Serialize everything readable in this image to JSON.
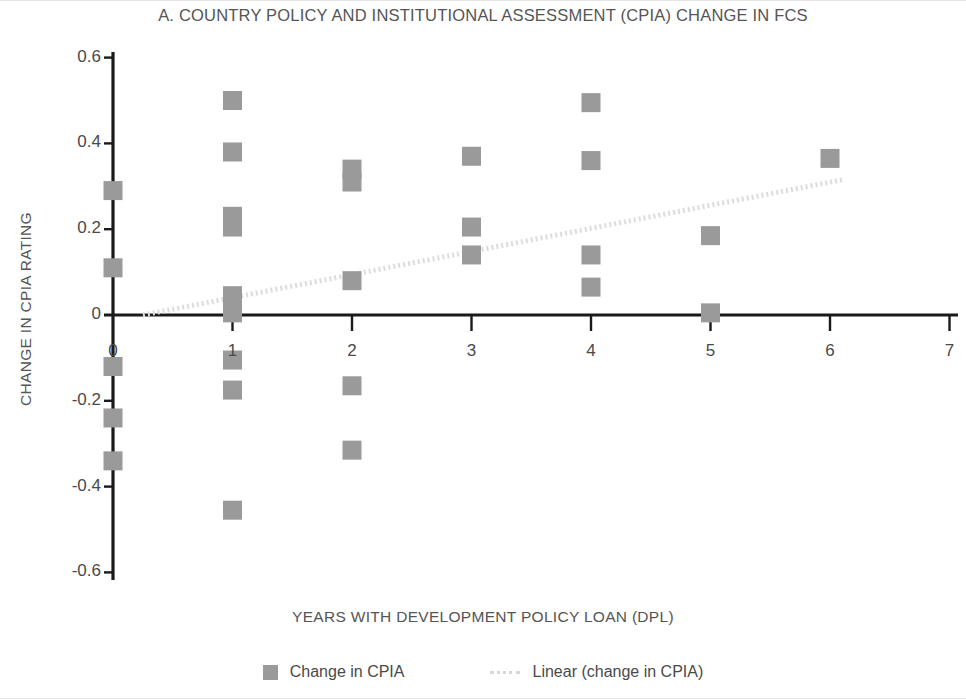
{
  "chart_data": {
    "type": "scatter",
    "title": "A. COUNTRY POLICY AND INSTITUTIONAL ASSESSMENT (CPIA) CHANGE IN FCS",
    "xlabel": "YEARS WITH DEVELOPMENT POLICY LOAN (DPL)",
    "ylabel": "CHANGE IN CPIA RATING",
    "xlim": [
      0,
      7
    ],
    "ylim": [
      -0.6,
      0.6
    ],
    "xticks": [
      "0",
      "1",
      "2",
      "3",
      "4",
      "5",
      "6",
      "7"
    ],
    "yticks": [
      "0.6",
      "0.4",
      "0.2",
      "0",
      "-0.2",
      "-0.4",
      "-0.6"
    ],
    "grid": false,
    "legend_position": "bottom",
    "series": [
      {
        "name": "Change in CPIA",
        "type": "scatter",
        "marker": "square",
        "color": "#9a9a9a",
        "points": [
          {
            "x": 0,
            "y": 0.29
          },
          {
            "x": 0,
            "y": 0.11
          },
          {
            "x": 0,
            "y": -0.12
          },
          {
            "x": 0,
            "y": -0.24
          },
          {
            "x": 0,
            "y": -0.34
          },
          {
            "x": 1,
            "y": 0.5
          },
          {
            "x": 1,
            "y": 0.38
          },
          {
            "x": 1,
            "y": 0.23
          },
          {
            "x": 1,
            "y": 0.205
          },
          {
            "x": 1,
            "y": 0.045
          },
          {
            "x": 1,
            "y": 0.005
          },
          {
            "x": 1,
            "y": -0.105
          },
          {
            "x": 1,
            "y": -0.175
          },
          {
            "x": 1,
            "y": -0.455
          },
          {
            "x": 2,
            "y": 0.34
          },
          {
            "x": 2,
            "y": 0.31
          },
          {
            "x": 2,
            "y": 0.08
          },
          {
            "x": 2,
            "y": -0.165
          },
          {
            "x": 2,
            "y": -0.315
          },
          {
            "x": 3,
            "y": 0.37
          },
          {
            "x": 3,
            "y": 0.205
          },
          {
            "x": 3,
            "y": 0.14
          },
          {
            "x": 4,
            "y": 0.495
          },
          {
            "x": 4,
            "y": 0.36
          },
          {
            "x": 4,
            "y": 0.14
          },
          {
            "x": 4,
            "y": 0.065
          },
          {
            "x": 5,
            "y": 0.185
          },
          {
            "x": 5,
            "y": 0.005
          },
          {
            "x": 6,
            "y": 0.365
          }
        ]
      },
      {
        "name": "Linear (change in CPIA)",
        "type": "line",
        "style": "dotted",
        "color": "#dcdcdc",
        "trendline": {
          "x0": 0.25,
          "y0": 0.0,
          "x1": 6.1,
          "y1": 0.315
        }
      }
    ]
  },
  "legend": {
    "items": [
      {
        "label": "Change in CPIA",
        "marker": "square",
        "color": "#9a9a9a"
      },
      {
        "label": "Linear (change in CPIA)",
        "marker": "line",
        "color": "#dcdcdc"
      }
    ]
  },
  "colors": {
    "marker": "#9a9a9a",
    "trendline": "#dcdcdc",
    "axis": "#1a1a1a",
    "text": "#4a4a4a",
    "background": "#ffffff"
  }
}
